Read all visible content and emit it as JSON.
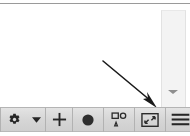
{
  "window": {
    "background_color": "#ffffff",
    "toolbar_color": "#d8d8d8",
    "icon_color": "#2b2b2b",
    "separator_color": "#b2b2b2",
    "panel_color": "#f3f3f3",
    "annotation_color": "#1a1a1a"
  },
  "canvas": {
    "label": "Viewport"
  },
  "side_panel": {
    "label": "Side panel",
    "overflow_chevron": {
      "name": "chevron-down-icon",
      "glyph": "▼"
    }
  },
  "annotation": {
    "type": "arrow",
    "label": "Arrow pointing to menu button",
    "direction": "down-right",
    "target": "menu-button"
  },
  "toolbar": {
    "label": "Bottom toolbar",
    "items": [
      {
        "id": "settings",
        "name": "gear-icon",
        "label": "Settings",
        "interactable": true
      },
      {
        "id": "settings-menu",
        "name": "caret-down-icon",
        "label": "Settings menu",
        "interactable": true
      },
      {
        "id": "add",
        "name": "plus-icon",
        "label": "Add",
        "interactable": true
      },
      {
        "id": "record",
        "name": "record-circle-icon",
        "label": "Record",
        "interactable": true
      },
      {
        "id": "shapes",
        "name": "shapes-icon",
        "label": "Shapes",
        "interactable": true
      },
      {
        "id": "fit",
        "name": "fit-to-screen-icon",
        "label": "Fit to screen",
        "interactable": true
      },
      {
        "id": "menu",
        "name": "hamburger-menu-icon",
        "label": "Menu",
        "interactable": true
      }
    ]
  }
}
